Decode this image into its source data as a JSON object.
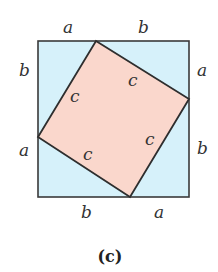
{
  "figure": {
    "caption": "(c)",
    "colors": {
      "outer_fill": "#d6f1fa",
      "inner_fill": "#fad7cc",
      "stroke": "#3a3a3a"
    },
    "outer_square": {
      "x": 38,
      "y": 41,
      "size": 151
    },
    "inner_square_vertices": [
      [
        96,
        41
      ],
      [
        189,
        99
      ],
      [
        130,
        197
      ],
      [
        38,
        137
      ]
    ],
    "labels": {
      "top": [
        "a",
        "b"
      ],
      "right": [
        "a",
        "b"
      ],
      "bottom": [
        "b",
        "a"
      ],
      "left": [
        "b",
        "a"
      ],
      "inner": [
        "c",
        "c",
        "c",
        "c"
      ]
    }
  }
}
